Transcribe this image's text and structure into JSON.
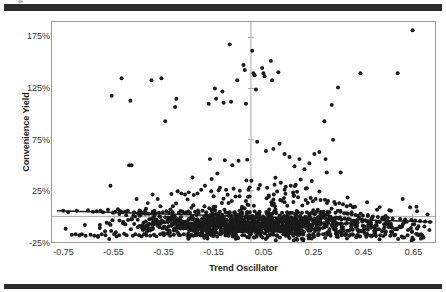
{
  "figure": {
    "top_rule": "",
    "bottom_rule": ""
  },
  "chart_data": {
    "type": "scatter",
    "title": "",
    "xlabel": "Trend Oscillator",
    "ylabel": "Convenience Yield",
    "xlim": [
      -0.8,
      0.74
    ],
    "ylim": [
      -0.25,
      1.9
    ],
    "grid": false,
    "legend": null,
    "xticks": [
      -0.75,
      -0.55,
      -0.35,
      -0.15,
      0.05,
      0.25,
      0.45,
      0.65
    ],
    "xticklabels": [
      "-0.75",
      "-0.55",
      "-0.35",
      "-0.15",
      "0.05",
      "0.25",
      "0.45",
      "0.65"
    ],
    "yticks": [
      1.75,
      1.25,
      0.75,
      0.25,
      -0.25
    ],
    "yticklabels": [
      "175%",
      "125%",
      "75%",
      "25%",
      "-25%"
    ],
    "marker": {
      "shape": "circle",
      "color": "#1a1a1a",
      "size": 2.0
    },
    "axis_lines": {
      "x_zero": 0.0,
      "y_zero": 0.0,
      "color": "#a9a9a9"
    },
    "trendline": {
      "type": "linear",
      "color": "#1a1a1a",
      "x_start": -0.78,
      "y_start": 0.055,
      "x_end": 0.73,
      "y_end": -0.055,
      "slope": -0.0728,
      "intercept": -0.00178
    },
    "series": [
      {
        "name": "Convenience Yield vs Trend Oscillator",
        "n_points": 1400,
        "points": [
          [
            -0.755,
            0.055
          ],
          [
            -0.745,
            -0.12
          ],
          [
            -0.735,
            0.04
          ],
          [
            -0.72,
            -0.18
          ],
          [
            -0.705,
            -0.175
          ],
          [
            -0.7,
            0.055
          ],
          [
            -0.69,
            -0.185
          ],
          [
            -0.68,
            -0.175
          ],
          [
            -0.665,
            -0.19
          ],
          [
            -0.655,
            0.06
          ],
          [
            -0.645,
            -0.18
          ],
          [
            -0.635,
            0.045
          ],
          [
            -0.63,
            -0.19
          ],
          [
            -0.62,
            0.05
          ],
          [
            -0.615,
            -0.2
          ],
          [
            -0.605,
            0.055
          ],
          [
            -0.6,
            -0.175
          ],
          [
            -0.595,
            0.04
          ],
          [
            -0.585,
            -0.185
          ],
          [
            -0.575,
            0.065
          ],
          [
            -0.57,
            -0.22
          ],
          [
            -0.565,
            0.3
          ],
          [
            -0.56,
            1.18
          ],
          [
            -0.555,
            0.035
          ],
          [
            -0.55,
            -0.175
          ],
          [
            -0.545,
            0.045
          ],
          [
            -0.54,
            -0.195
          ],
          [
            -0.535,
            0.07
          ],
          [
            -0.53,
            -0.185
          ],
          [
            -0.525,
            0.05
          ],
          [
            -0.52,
            1.35
          ],
          [
            -0.515,
            0.04
          ],
          [
            -0.51,
            -0.17
          ],
          [
            -0.505,
            0.045
          ],
          [
            -0.5,
            -0.185
          ],
          [
            -0.495,
            0.055
          ],
          [
            -0.49,
            0.5
          ],
          [
            -0.485,
            1.13
          ],
          [
            -0.48,
            0.5
          ],
          [
            -0.475,
            -0.19
          ],
          [
            -0.47,
            0.04
          ],
          [
            -0.465,
            -0.175
          ],
          [
            -0.46,
            0.17
          ],
          [
            -0.455,
            0.03
          ],
          [
            -0.45,
            -0.185
          ],
          [
            -0.445,
            0.05
          ],
          [
            -0.44,
            -0.195
          ],
          [
            -0.435,
            0.035
          ],
          [
            -0.43,
            -0.175
          ],
          [
            -0.425,
            0.055
          ],
          [
            -0.42,
            -0.185
          ],
          [
            -0.415,
            0.13
          ],
          [
            -0.41,
            0.025
          ],
          [
            -0.405,
            -0.19
          ],
          [
            -0.4,
            1.33
          ],
          [
            -0.395,
            0.045
          ],
          [
            -0.39,
            -0.18
          ],
          [
            -0.385,
            0.03
          ],
          [
            -0.38,
            -0.195
          ],
          [
            -0.375,
            0.17
          ],
          [
            -0.37,
            0.035
          ],
          [
            -0.365,
            -0.175
          ],
          [
            -0.36,
            1.35
          ],
          [
            -0.355,
            0.04
          ],
          [
            -0.35,
            -0.185
          ],
          [
            -0.345,
            0.93
          ],
          [
            -0.34,
            0.05
          ],
          [
            -0.335,
            -0.17
          ],
          [
            -0.33,
            0.035
          ],
          [
            -0.325,
            -0.19
          ],
          [
            -0.32,
            0.22
          ],
          [
            -0.315,
            0.04
          ],
          [
            -0.31,
            -0.18
          ],
          [
            -0.305,
            1.07
          ],
          [
            -0.3,
            1.15
          ],
          [
            -0.295,
            0.245
          ],
          [
            -0.29,
            0.035
          ],
          [
            -0.285,
            -0.185
          ],
          [
            -0.28,
            0.225
          ],
          [
            -0.275,
            0.045
          ],
          [
            -0.27,
            -0.175
          ],
          [
            -0.265,
            0.215
          ],
          [
            -0.26,
            0.04
          ],
          [
            -0.255,
            -0.19
          ],
          [
            -0.25,
            0.235
          ],
          [
            -0.245,
            0.035
          ],
          [
            -0.24,
            -0.18
          ],
          [
            -0.235,
            0.38
          ],
          [
            -0.23,
            0.21
          ],
          [
            -0.225,
            0.045
          ],
          [
            -0.22,
            -0.185
          ],
          [
            -0.215,
            0.225
          ],
          [
            -0.21,
            0.035
          ],
          [
            -0.205,
            -0.175
          ],
          [
            -0.2,
            0.26
          ],
          [
            -0.195,
            0.055
          ],
          [
            -0.19,
            -0.19
          ],
          [
            -0.185,
            0.3
          ],
          [
            -0.18,
            0.04
          ],
          [
            -0.175,
            -0.18
          ],
          [
            -0.17,
            1.1
          ],
          [
            -0.165,
            0.56
          ],
          [
            -0.16,
            0.245
          ],
          [
            -0.155,
            0.035
          ],
          [
            -0.15,
            -0.185
          ],
          [
            -0.145,
            1.25
          ],
          [
            -0.14,
            1.15
          ],
          [
            -0.135,
            0.42
          ],
          [
            -0.13,
            0.255
          ],
          [
            -0.125,
            0.045
          ],
          [
            -0.12,
            -0.175
          ],
          [
            -0.115,
            1.22
          ],
          [
            -0.11,
            1.11
          ],
          [
            -0.105,
            0.55
          ],
          [
            -0.1,
            0.26
          ],
          [
            -0.095,
            0.035
          ],
          [
            -0.09,
            -0.19
          ],
          [
            -0.085,
            1.68
          ],
          [
            -0.08,
            1.12
          ],
          [
            -0.075,
            0.5
          ],
          [
            -0.07,
            0.27
          ],
          [
            -0.065,
            0.04
          ],
          [
            -0.06,
            -0.18
          ],
          [
            -0.055,
            1.33
          ],
          [
            -0.05,
            0.545
          ],
          [
            -0.045,
            0.25
          ],
          [
            -0.04,
            0.035
          ],
          [
            -0.035,
            -0.185
          ],
          [
            -0.03,
            1.48
          ],
          [
            -0.025,
            1.43
          ],
          [
            -0.02,
            1.1
          ],
          [
            -0.015,
            0.555
          ],
          [
            -0.01,
            0.26
          ],
          [
            -0.005,
            0.04
          ],
          [
            0.0,
            -0.175
          ],
          [
            0.005,
            1.62
          ],
          [
            0.01,
            1.4
          ],
          [
            0.015,
            1.38
          ],
          [
            0.02,
            1.24
          ],
          [
            0.025,
            0.73
          ],
          [
            0.03,
            0.27
          ],
          [
            0.035,
            0.045
          ],
          [
            0.04,
            -0.19
          ],
          [
            0.045,
            1.45
          ],
          [
            0.05,
            1.4
          ],
          [
            0.055,
            1.37
          ],
          [
            0.06,
            0.64
          ],
          [
            0.065,
            0.28
          ],
          [
            0.07,
            0.035
          ],
          [
            0.075,
            -0.18
          ],
          [
            0.08,
            1.52
          ],
          [
            0.085,
            1.33
          ],
          [
            0.09,
            0.66
          ],
          [
            0.095,
            0.31
          ],
          [
            0.1,
            0.045
          ],
          [
            0.105,
            -0.185
          ],
          [
            0.11,
            1.41
          ],
          [
            0.115,
            0.71
          ],
          [
            0.12,
            0.33
          ],
          [
            0.125,
            0.035
          ],
          [
            0.13,
            -0.175
          ],
          [
            0.135,
            0.61
          ],
          [
            0.14,
            0.29
          ],
          [
            0.145,
            0.04
          ],
          [
            0.15,
            -0.19
          ],
          [
            0.155,
            0.58
          ],
          [
            0.16,
            0.3
          ],
          [
            0.165,
            0.035
          ],
          [
            0.17,
            -0.18
          ],
          [
            0.175,
            0.49
          ],
          [
            0.18,
            0.31
          ],
          [
            0.185,
            0.045
          ],
          [
            0.19,
            -0.185
          ],
          [
            0.195,
            0.56
          ],
          [
            0.2,
            0.36
          ],
          [
            0.205,
            0.035
          ],
          [
            0.21,
            -0.175
          ],
          [
            0.215,
            0.46
          ],
          [
            0.22,
            0.16
          ],
          [
            0.225,
            0.04
          ],
          [
            0.23,
            -0.19
          ],
          [
            0.235,
            0.52
          ],
          [
            0.24,
            0.18
          ],
          [
            0.245,
            0.035
          ],
          [
            0.25,
            -0.18
          ],
          [
            0.255,
            0.61
          ],
          [
            0.26,
            0.17
          ],
          [
            0.265,
            0.045
          ],
          [
            0.27,
            -0.185
          ],
          [
            0.275,
            0.63
          ],
          [
            0.28,
            0.16
          ],
          [
            0.285,
            0.035
          ],
          [
            0.29,
            -0.175
          ],
          [
            0.295,
            0.93
          ],
          [
            0.3,
            0.56
          ],
          [
            0.305,
            0.43
          ],
          [
            0.31,
            0.15
          ],
          [
            0.315,
            0.04
          ],
          [
            0.32,
            -0.19
          ],
          [
            0.325,
            1.09
          ],
          [
            0.33,
            0.75
          ],
          [
            0.335,
            0.14
          ],
          [
            0.34,
            0.035
          ],
          [
            0.345,
            -0.18
          ],
          [
            0.35,
            1.26
          ],
          [
            0.355,
            0.13
          ],
          [
            0.36,
            0.045
          ],
          [
            0.365,
            -0.185
          ],
          [
            0.37,
            0.12
          ],
          [
            0.375,
            0.03
          ],
          [
            0.38,
            -0.175
          ],
          [
            0.385,
            0.1
          ],
          [
            0.39,
            0.025
          ],
          [
            0.395,
            -0.19
          ],
          [
            0.4,
            0.11
          ],
          [
            0.405,
            0.02
          ],
          [
            0.41,
            -0.18
          ],
          [
            0.42,
            0.015
          ],
          [
            0.43,
            -0.185
          ],
          [
            0.44,
            1.4
          ],
          [
            0.45,
            0.01
          ],
          [
            0.46,
            -0.175
          ],
          [
            0.47,
            0.005
          ],
          [
            0.48,
            -0.19
          ],
          [
            0.49,
            0.0
          ],
          [
            0.5,
            -0.18
          ],
          [
            0.51,
            -0.005
          ],
          [
            0.52,
            -0.185
          ],
          [
            0.53,
            -0.01
          ],
          [
            0.54,
            -0.175
          ],
          [
            0.55,
            -0.015
          ],
          [
            0.56,
            -0.19
          ],
          [
            0.57,
            -0.02
          ],
          [
            0.58,
            -0.18
          ],
          [
            0.59,
            1.4
          ],
          [
            0.6,
            -0.025
          ],
          [
            0.61,
            0.17
          ],
          [
            0.62,
            -0.03
          ],
          [
            0.63,
            -0.185
          ],
          [
            0.64,
            0.09
          ],
          [
            0.645,
            -0.035
          ],
          [
            0.65,
            1.82
          ],
          [
            0.66,
            -0.04
          ],
          [
            0.67,
            -0.175
          ],
          [
            0.68,
            -0.045
          ],
          [
            0.69,
            -0.19
          ],
          [
            0.7,
            -0.05
          ],
          [
            0.71,
            0.02
          ],
          [
            0.72,
            -0.055
          ]
        ]
      }
    ]
  },
  "axis_titles": {
    "x": "Trend Oscillator",
    "y": "Convenience Yield"
  }
}
